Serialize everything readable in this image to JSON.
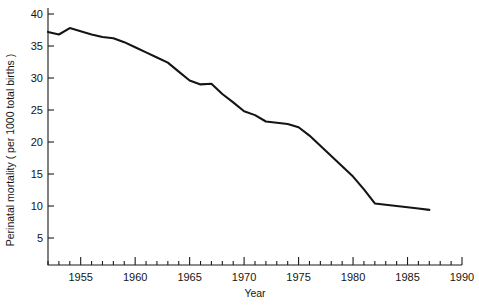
{
  "chart_data": {
    "type": "line",
    "title": "",
    "xlabel": "Year",
    "ylabel": "Perinatal mortality ( per 1000 total births )",
    "xlim": [
      1952,
      1990
    ],
    "ylim": [
      0,
      40
    ],
    "grid": false,
    "legend": null,
    "x_major_ticks": [
      1955,
      1960,
      1965,
      1970,
      1975,
      1980,
      1985,
      1990
    ],
    "x_major_tick_labels": [
      "1955",
      "1960",
      "1965",
      "1970",
      "1975",
      "1980",
      "1985",
      "1990"
    ],
    "x_minor_tick_interval": 1,
    "y_major_ticks": [
      5,
      10,
      15,
      20,
      25,
      30,
      35,
      40
    ],
    "y_major_tick_labels": [
      "5",
      "10",
      "15",
      "20",
      "25",
      "30",
      "35",
      "40"
    ],
    "series": [
      {
        "name": "Perinatal mortality",
        "color": "#141414",
        "x": [
          1952,
          1953,
          1954,
          1955,
          1956,
          1957,
          1958,
          1959,
          1960,
          1961,
          1962,
          1963,
          1964,
          1965,
          1966,
          1967,
          1968,
          1969,
          1970,
          1971,
          1972,
          1973,
          1974,
          1975,
          1976,
          1977,
          1978,
          1979,
          1980,
          1981,
          1982,
          1983,
          1984,
          1985,
          1986,
          1987
        ],
        "y": [
          37.2,
          36.8,
          37.8,
          37.3,
          36.8,
          36.4,
          36.2,
          35.6,
          34.8,
          34.0,
          33.2,
          32.4,
          31.0,
          29.6,
          29.0,
          29.1,
          27.5,
          26.2,
          24.8,
          24.2,
          23.2,
          23.0,
          22.8,
          22.3,
          21.0,
          19.4,
          17.8,
          16.2,
          14.6,
          12.6,
          10.4,
          10.2,
          10.0,
          9.8,
          9.6,
          9.4
        ]
      }
    ]
  }
}
